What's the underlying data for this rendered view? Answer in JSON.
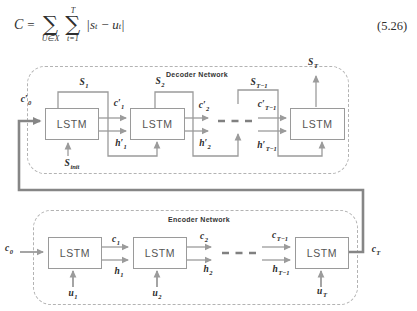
{
  "equation": {
    "lhs": "C",
    "equals": "=",
    "sum1": {
      "symbol": "∑",
      "sup": "",
      "sub": "U∈X"
    },
    "sum2": {
      "symbol": "∑",
      "sup": "T",
      "sub": "t=1"
    },
    "term": {
      "p1": "|s",
      "s1": "t",
      "op": "−",
      "p2": "u",
      "s2": "t",
      "p3": "|"
    },
    "number": "(5.26)"
  },
  "diagram": {
    "decoder": {
      "title": "Decoder Network",
      "lstm": "LSTM",
      "labels": {
        "s1": {
          "main": "S",
          "sub": "1"
        },
        "s2": {
          "main": "S",
          "sub": "2"
        },
        "st1": {
          "main": "S",
          "sub": "T−1"
        },
        "st": {
          "main": "S",
          "sub": "T"
        },
        "cp1": {
          "main": "c′",
          "sub": "1"
        },
        "hp1": {
          "main": "h′",
          "sub": "1"
        },
        "cp2": {
          "main": "c′",
          "sub": "2"
        },
        "hp2": {
          "main": "h′",
          "sub": "2"
        },
        "cpt1": {
          "main": "c′",
          "sub": "T−1"
        },
        "hpt1": {
          "main": "h′",
          "sub": "T−1"
        },
        "cp0": {
          "main": "c′",
          "sub": "0"
        },
        "sinit": {
          "main": "S",
          "sub": "init"
        }
      }
    },
    "encoder": {
      "title": "Encoder Network",
      "lstm": "LSTM",
      "labels": {
        "c0": {
          "main": "c",
          "sub": "0"
        },
        "c1": {
          "main": "c",
          "sub": "1"
        },
        "h1": {
          "main": "h",
          "sub": "1"
        },
        "c2": {
          "main": "c",
          "sub": "2"
        },
        "h2": {
          "main": "h",
          "sub": "2"
        },
        "ct1": {
          "main": "c",
          "sub": "T−1"
        },
        "ht1": {
          "main": "h",
          "sub": "T−1"
        },
        "ct": {
          "main": "c",
          "sub": "T"
        },
        "u1": {
          "main": "u",
          "sub": "1"
        },
        "u2": {
          "main": "u",
          "sub": "2"
        },
        "ut": {
          "main": "u",
          "sub": "T"
        }
      }
    },
    "colors": {
      "wire": "#9b9b9b",
      "thick_wire": "#868686",
      "box_border": "#9a9a9a",
      "dashed_border": "#b3b3b3",
      "text": "#2b2b2b"
    }
  }
}
